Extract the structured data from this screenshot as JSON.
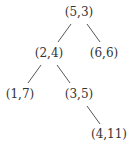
{
  "diagram": {
    "type": "binary-tree",
    "nodes": [
      {
        "id": "n1",
        "label": "(5,3)",
        "x": 79,
        "y": 16
      },
      {
        "id": "n2",
        "label": "(2,4)",
        "x": 49,
        "y": 57
      },
      {
        "id": "n3",
        "label": "(6,6)",
        "x": 104,
        "y": 57
      },
      {
        "id": "n4",
        "label": "(1,7)",
        "x": 20,
        "y": 98
      },
      {
        "id": "n5",
        "label": "(3,5)",
        "x": 79,
        "y": 98
      },
      {
        "id": "n6",
        "label": "(4,11)",
        "x": 109,
        "y": 138
      }
    ],
    "edges": [
      {
        "from": "(5,3)",
        "to": "(2,4)"
      },
      {
        "from": "(5,3)",
        "to": "(6,6)"
      },
      {
        "from": "(2,4)",
        "to": "(1,7)"
      },
      {
        "from": "(2,4)",
        "to": "(3,5)"
      },
      {
        "from": "(3,5)",
        "to": "(4,11)"
      }
    ],
    "colors": {
      "text": "#333333",
      "edge": "#444444",
      "background": "#ffffff"
    }
  }
}
